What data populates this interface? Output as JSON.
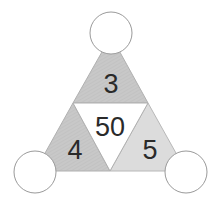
{
  "diagram": {
    "type": "number-triangle",
    "center_value": "50",
    "sections": [
      {
        "position": "top",
        "value": "3",
        "fill": "#c6c6c6"
      },
      {
        "position": "left",
        "value": "4",
        "fill": "#c4c4c4"
      },
      {
        "position": "right",
        "value": "5",
        "fill": "#dcdcdc"
      }
    ],
    "center_fill": "#ffffff",
    "corner_circles": [
      {
        "position": "top",
        "value": ""
      },
      {
        "position": "bottom-left",
        "value": ""
      },
      {
        "position": "bottom-right",
        "value": ""
      }
    ],
    "colors": {
      "stroke": "#a8a8a8",
      "circle_stroke": "#9a9a9a",
      "text": "#2a2a2a"
    }
  }
}
